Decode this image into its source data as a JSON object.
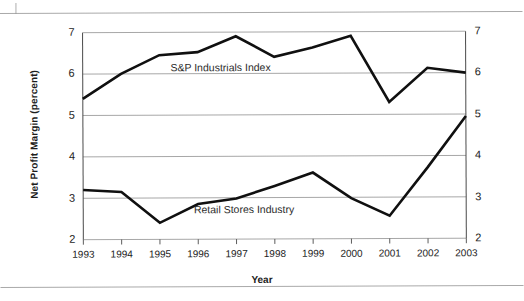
{
  "chart_data": {
    "type": "line",
    "title": "",
    "subtitle": "",
    "xlabel": "Year",
    "ylabel": "Net Profit Margin (percent)",
    "categories": [
      "1993",
      "1994",
      "1995",
      "1996",
      "1997",
      "1998",
      "1999",
      "2000",
      "2001",
      "2002",
      "2003"
    ],
    "x": [
      1993,
      1994,
      1995,
      1996,
      1997,
      1998,
      1999,
      2000,
      2001,
      2002,
      2003
    ],
    "ylim": [
      2,
      7
    ],
    "xlim": [
      1993,
      2003
    ],
    "yticks": [
      "2",
      "3",
      "4",
      "5",
      "6",
      "7"
    ],
    "ytick_values": [
      2,
      3,
      4,
      5,
      6,
      7
    ],
    "grid": "horizontal",
    "legend_position": "inline-labels",
    "series": [
      {
        "name": "S&P Industrials Index",
        "color": "#101010",
        "values": [
          5.4,
          6.0,
          6.45,
          6.52,
          6.9,
          6.4,
          6.62,
          6.9,
          5.3,
          6.12,
          6.0
        ]
      },
      {
        "name": "Retail Stores Industry",
        "color": "#101010",
        "values": [
          3.2,
          3.15,
          2.4,
          2.85,
          2.98,
          3.28,
          3.6,
          2.98,
          2.55,
          3.72,
          4.95
        ]
      }
    ],
    "annotations": [
      {
        "text": "S&P Industrials Index",
        "x": 1996.6,
        "y": 6.12
      },
      {
        "text": "Retail Stores Industry",
        "x": 1997.2,
        "y": 2.7
      }
    ],
    "axis_labels_right": [
      "2",
      "3",
      "4",
      "5",
      "6",
      "7"
    ]
  },
  "figure": {
    "background": "#ffffff",
    "line_color": "#101010",
    "grid_color": "#9d9d9d",
    "axis_color": "#4a4a4a"
  }
}
